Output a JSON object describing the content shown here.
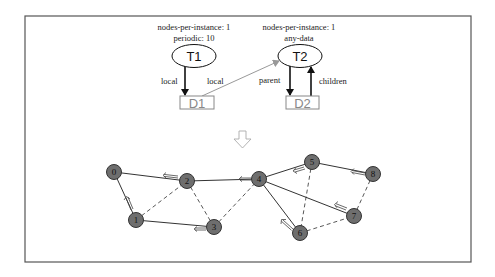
{
  "figure": {
    "type": "task-graph-to-network-mapping",
    "frame_color": "#555555"
  },
  "task_graph": {
    "tasks": [
      {
        "id": "T1",
        "label": "T1",
        "attributes": [
          "nodes-per-instance: 1",
          "periodic: 10"
        ],
        "cx": 194,
        "cy": 56
      },
      {
        "id": "T2",
        "label": "T2",
        "attributes": [
          "nodes-per-instance: 1",
          "any-data"
        ],
        "cx": 300,
        "cy": 56
      }
    ],
    "data_items": [
      {
        "id": "D1",
        "label": "D1",
        "x": 180,
        "y": 96,
        "w": 34,
        "h": 13
      },
      {
        "id": "D2",
        "label": "D2",
        "x": 286,
        "y": 96,
        "w": 33,
        "h": 13
      }
    ],
    "edges": [
      {
        "from": "T1",
        "to": "D1",
        "label": "local",
        "style": "dark"
      },
      {
        "from": "D1",
        "to": "T2",
        "label": "local",
        "style": "grey"
      },
      {
        "from": "T2",
        "to": "D2",
        "label": "parent",
        "style": "dark"
      },
      {
        "from": "D2",
        "to": "T2",
        "label": "children",
        "style": "dark"
      }
    ]
  },
  "transform_arrow": {
    "icon": "hollow-down-arrow-icon",
    "x": 242,
    "y": 139
  },
  "network": {
    "node_fill": "#6e6e6e",
    "nodes": [
      {
        "id": "0",
        "label": "0",
        "x": 114,
        "y": 172
      },
      {
        "id": "1",
        "label": "1",
        "x": 136,
        "y": 220
      },
      {
        "id": "2",
        "label": "2",
        "x": 187,
        "y": 181
      },
      {
        "id": "3",
        "label": "3",
        "x": 214,
        "y": 227
      },
      {
        "id": "4",
        "label": "4",
        "x": 259,
        "y": 179
      },
      {
        "id": "5",
        "label": "5",
        "x": 312,
        "y": 162
      },
      {
        "id": "6",
        "label": "6",
        "x": 300,
        "y": 233
      },
      {
        "id": "7",
        "label": "7",
        "x": 354,
        "y": 216
      },
      {
        "id": "8",
        "label": "8",
        "x": 373,
        "y": 174
      }
    ],
    "solid_edges": [
      [
        "0",
        "2"
      ],
      [
        "0",
        "1"
      ],
      [
        "1",
        "3"
      ],
      [
        "2",
        "4"
      ],
      [
        "4",
        "5"
      ],
      [
        "5",
        "8"
      ],
      [
        "4",
        "7"
      ],
      [
        "4",
        "6"
      ]
    ],
    "dashed_edges": [
      [
        "1",
        "2"
      ],
      [
        "2",
        "3"
      ],
      [
        "3",
        "4"
      ],
      [
        "5",
        "6"
      ],
      [
        "6",
        "7"
      ],
      [
        "7",
        "8"
      ]
    ],
    "flow_arrows": [
      {
        "on_edge": [
          "2",
          "0"
        ],
        "direction": "toward 0"
      },
      {
        "on_edge": [
          "1",
          "0"
        ],
        "direction": "toward 0"
      },
      {
        "on_edge": [
          "3",
          "1"
        ],
        "direction": "toward 1"
      },
      {
        "on_edge": [
          "4",
          "2"
        ],
        "direction": "toward 2"
      },
      {
        "on_edge": [
          "5",
          "4"
        ],
        "direction": "toward 4"
      },
      {
        "on_edge": [
          "8",
          "5"
        ],
        "direction": "toward 5"
      },
      {
        "on_edge": [
          "7",
          "4"
        ],
        "direction": "toward 4"
      },
      {
        "on_edge": [
          "6",
          "4"
        ],
        "direction": "toward 4"
      }
    ]
  }
}
